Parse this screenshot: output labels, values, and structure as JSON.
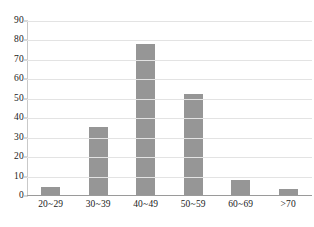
{
  "chart_data": {
    "type": "bar",
    "title": "",
    "subtitle": "",
    "xlabel": "",
    "ylabel": "",
    "categories": [
      "20~29",
      "30~39",
      "40~49",
      "50~59",
      "60~69",
      ">70"
    ],
    "values": [
      4,
      35,
      78,
      52,
      8,
      3
    ],
    "series": [
      {
        "name": "",
        "values": [
          4,
          35,
          78,
          52,
          8,
          3
        ]
      }
    ],
    "ylim": [
      0,
      90
    ],
    "ytick_labels": [
      "90",
      "80",
      "70",
      "60",
      "50",
      "40",
      "30",
      "20",
      "10",
      "0"
    ],
    "ytick_values": [
      90,
      80,
      70,
      60,
      50,
      40,
      30,
      20,
      10,
      0
    ],
    "ytick_step": 10,
    "grid": true,
    "grid_axis": "y",
    "legend": false,
    "legend_position": "none",
    "bar_color": "#969696",
    "gridline_color": "#e3e3e3",
    "axis_color": "#9a9a9a",
    "background_color": "#ffffff",
    "annotations": []
  }
}
